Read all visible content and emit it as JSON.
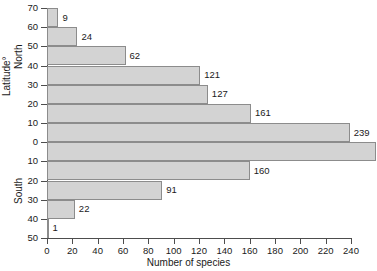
{
  "chart_data": {
    "type": "bar",
    "orientation": "horizontal",
    "title": "",
    "xlabel": "Number of species",
    "ylabel": "Latitude°",
    "xlim": [
      0,
      240
    ],
    "ylim": [
      -50,
      70
    ],
    "grid": false,
    "legend": null,
    "xticks": [
      0,
      20,
      40,
      60,
      80,
      100,
      120,
      140,
      160,
      180,
      200,
      220,
      240
    ],
    "yticks": [
      "70",
      "60",
      "50",
      "40",
      "30",
      "20",
      "10",
      "0",
      "10",
      "20",
      "30",
      "40",
      "50"
    ],
    "hemisphere_labels": [
      "North",
      "South"
    ],
    "categories": [
      "60-70 N",
      "50-60 N",
      "40-50 N",
      "30-40 N",
      "20-30 N",
      "10-20 N",
      "0-10 N",
      "0-10 S",
      "10-20 S",
      "20-30 S",
      "30-40 S",
      "40-50 S"
    ],
    "values": [
      9,
      24,
      62,
      121,
      127,
      161,
      239,
      260,
      160,
      91,
      22,
      1
    ],
    "bars": [
      {
        "label": "9",
        "value": 9,
        "band_top": "70",
        "band_bottom": "60"
      },
      {
        "label": "24",
        "value": 24,
        "band_top": "60",
        "band_bottom": "50"
      },
      {
        "label": "62",
        "value": 62,
        "band_top": "50",
        "band_bottom": "40"
      },
      {
        "label": "121",
        "value": 121,
        "band_top": "40",
        "band_bottom": "30"
      },
      {
        "label": "127",
        "value": 127,
        "band_top": "30",
        "band_bottom": "20"
      },
      {
        "label": "161",
        "value": 161,
        "band_top": "20",
        "band_bottom": "10"
      },
      {
        "label": "239",
        "value": 239,
        "band_top": "10",
        "band_bottom": "0"
      },
      {
        "label": "260",
        "value": 260,
        "band_top": "0",
        "band_bottom": "10"
      },
      {
        "label": "160",
        "value": 160,
        "band_top": "10",
        "band_bottom": "20"
      },
      {
        "label": "91",
        "value": 91,
        "band_top": "20",
        "band_bottom": "30"
      },
      {
        "label": "22",
        "value": 22,
        "band_top": "30",
        "band_bottom": "40"
      },
      {
        "label": "1",
        "value": 1,
        "band_top": "40",
        "band_bottom": "50"
      }
    ],
    "colors": {
      "bar_fill": "#d3d3d3",
      "bar_edge": "#8c8c8c",
      "axis": "#4d4d4d",
      "text": "#1a1a1a",
      "background": "#ffffff"
    }
  }
}
